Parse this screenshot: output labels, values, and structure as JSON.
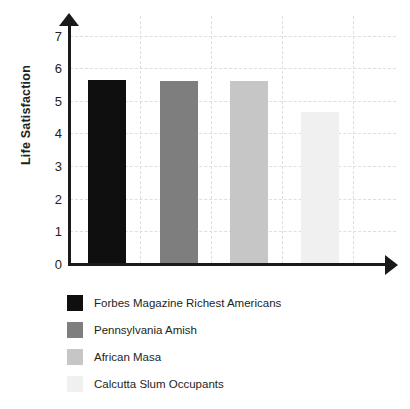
{
  "chart_data": {
    "type": "bar",
    "title": "",
    "subtitle": "",
    "xlabel": "",
    "ylabel": "Life Satisfaction",
    "categories": [
      "Forbes Magazine Richest Americans",
      "Pennsylvania Amish",
      "African Masa",
      "Calcutta Slum Occupants"
    ],
    "values": [
      5.65,
      5.62,
      5.62,
      4.65
    ],
    "ylim": [
      0,
      7.6
    ],
    "yticks": [
      0,
      1,
      2,
      3,
      4,
      5,
      6,
      7
    ],
    "ytick_labels": [
      "0",
      "1",
      "2",
      "3",
      "4",
      "5",
      "6",
      "7"
    ],
    "xtick_labels": [],
    "grid": "dashed-both-axes",
    "legend_position": "below-plot",
    "series": [
      {
        "name": "Forbes Magazine Richest Americans",
        "value": 5.65,
        "color": "#100f10"
      },
      {
        "name": "Pennsylvania Amish",
        "value": 5.62,
        "color": "#7e7e7e"
      },
      {
        "name": "African Masa",
        "value": 5.62,
        "color": "#c6c6c6"
      },
      {
        "name": "Calcutta Slum Occupants",
        "value": 4.65,
        "color": "#f0f0f0"
      }
    ],
    "colors": {
      "axis": "#1a1a1a",
      "grid": "#dedede",
      "text": "#231f20",
      "background": "#ffffff"
    }
  },
  "axis": {
    "y_title": "Life Satisfaction",
    "ticks": [
      "7",
      "6",
      "5",
      "4",
      "3",
      "2",
      "1",
      "0"
    ]
  },
  "legend": {
    "items": [
      {
        "label": "Forbes Magazine Richest Americans",
        "color": "#100f10"
      },
      {
        "label": "Pennsylvania Amish",
        "color": "#7e7e7e"
      },
      {
        "label": "African Masa",
        "color": "#c6c6c6"
      },
      {
        "label": "Calcutta Slum Occupants",
        "color": "#f0f0f0"
      }
    ]
  }
}
